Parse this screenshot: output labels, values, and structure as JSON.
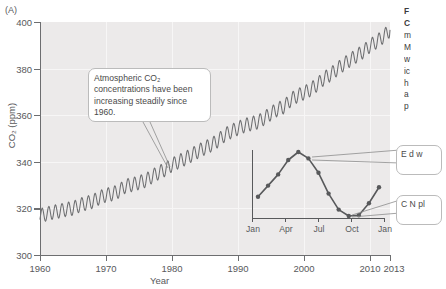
{
  "panel": {
    "label": "(A)"
  },
  "axes": {
    "y": {
      "title": "CO2 (ppm)",
      "title_display": "CO₂ (ppm)",
      "ticks": [
        300,
        320,
        340,
        360,
        380,
        400
      ],
      "min": 300,
      "max": 400
    },
    "x": {
      "title": "Year",
      "ticks": [
        "1960",
        "1970",
        "1980",
        "1990",
        "2000",
        "2010",
        "2013"
      ],
      "min": 1960,
      "max": 2013
    }
  },
  "callouts": {
    "main": "Atmospheric CO₂ concentrations have been increasing steadily since 1960.",
    "inset_top": "E d w",
    "inset_bottom": "C N pl"
  },
  "inset": {
    "ticks": [
      "Jan",
      "Apr",
      "Jul",
      "Oct",
      "Jan"
    ]
  },
  "caption": {
    "line1": "F",
    "line2": "C",
    "line3": "m",
    "line4": "M",
    "line5": "w",
    "line6": "ic",
    "line7": "h",
    "line8": "a",
    "line9": "p"
  },
  "colors": {
    "plot_background": "#eceaea",
    "axis": "#6d6e70",
    "curve": "#6d6e70",
    "inset_marker": "#58595b",
    "callout_border": "#bbbbbb",
    "text": "#58595b"
  },
  "chart_data": {
    "type": "line",
    "xlabel": "Year",
    "ylabel": "CO2 (ppm)",
    "xlim": [
      1960,
      2013
    ],
    "ylim": [
      300,
      400
    ],
    "grid": true,
    "legend": null,
    "annotations": [
      "Atmospheric CO₂ concentrations have been increasing steadily since 1960."
    ],
    "series": [
      {
        "name": "Annual mean CO2 (ppm)",
        "description": "Smooth rising trend with superimposed annual sawtooth oscillation of about 6 ppm peak-to-peak",
        "x": [
          1960,
          1961,
          1962,
          1963,
          1964,
          1965,
          1966,
          1967,
          1968,
          1969,
          1970,
          1971,
          1972,
          1973,
          1974,
          1975,
          1976,
          1977,
          1978,
          1979,
          1980,
          1981,
          1982,
          1983,
          1984,
          1985,
          1986,
          1987,
          1988,
          1989,
          1990,
          1991,
          1992,
          1993,
          1994,
          1995,
          1996,
          1997,
          1998,
          1999,
          2000,
          2001,
          2002,
          2003,
          2004,
          2005,
          2006,
          2007,
          2008,
          2009,
          2010,
          2011,
          2012,
          2013
        ],
        "values": [
          316.9,
          317.6,
          318.4,
          318.9,
          319.6,
          320.0,
          321.4,
          322.2,
          323.0,
          324.6,
          325.7,
          326.3,
          327.5,
          329.7,
          330.2,
          331.1,
          332.0,
          333.8,
          335.4,
          336.8,
          338.7,
          340.1,
          341.4,
          343.0,
          344.6,
          346.0,
          347.4,
          349.2,
          351.6,
          353.1,
          354.4,
          355.6,
          356.4,
          357.1,
          358.8,
          360.8,
          362.6,
          363.7,
          366.7,
          368.4,
          369.6,
          371.1,
          373.2,
          375.8,
          377.5,
          379.8,
          381.9,
          383.8,
          385.6,
          387.4,
          389.9,
          391.6,
          393.8,
          396.5
        ],
        "seasonal_amplitude_ppm": 6.0
      }
    ],
    "inset": {
      "type": "line",
      "title": "Seasonal cycle of CO2 within a single year",
      "xlabel": "",
      "ylabel": "",
      "categories": [
        "Jan",
        "Feb",
        "Mar",
        "Apr",
        "May",
        "Jun",
        "Jul",
        "Aug",
        "Sep",
        "Oct",
        "Nov",
        "Dec",
        "Jan"
      ],
      "tick_labels": [
        "Jan",
        "Apr",
        "Jul",
        "Oct",
        "Jan"
      ],
      "values": [
        1.2,
        1.9,
        2.6,
        3.5,
        4.0,
        3.6,
        2.7,
        1.4,
        0.4,
        0.0,
        0.05,
        0.8,
        1.8
      ],
      "markers": true,
      "units": "relative ppm deviation"
    }
  }
}
